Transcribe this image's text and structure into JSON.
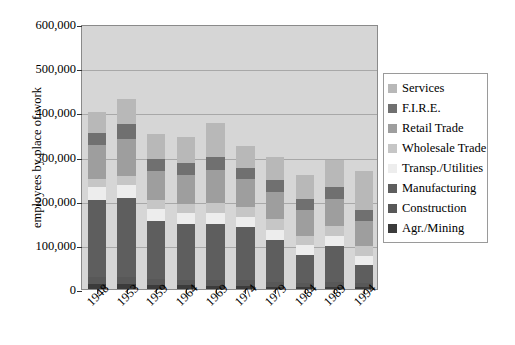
{
  "chart_data": {
    "type": "bar",
    "subtype": "stacked-bar",
    "title": "",
    "xlabel": "",
    "ylabel": "employees by place of work",
    "ylim": [
      0,
      600000
    ],
    "ytick_labels": [
      "600,000",
      "500,000",
      "400,000",
      "300,000",
      "200,000",
      "100,000",
      "0"
    ],
    "ytick_values": [
      600000,
      500000,
      400000,
      300000,
      200000,
      100000,
      0
    ],
    "grid": true,
    "legend_position": "right",
    "categories": [
      "1948",
      "1953",
      "1959",
      "1964",
      "1969",
      "1974",
      "1979",
      "1984",
      "1989",
      "1994"
    ],
    "series": [
      {
        "name": "Agr./Mining",
        "color": "#3b3b3b",
        "values": [
          12000,
          11000,
          9000,
          8000,
          7000,
          6000,
          5000,
          5000,
          5000,
          4000
        ]
      },
      {
        "name": "Construction",
        "color": "#585858",
        "values": [
          15000,
          16000,
          14000,
          13000,
          14000,
          14000,
          12000,
          9000,
          12000,
          9000
        ]
      },
      {
        "name": "Manufacturing",
        "color": "#5e5e5e",
        "values": [
          175000,
          178000,
          132000,
          126000,
          127000,
          120000,
          95000,
          64000,
          81000,
          42000
        ]
      },
      {
        "name": "Transp./Utilities",
        "color": "#ededed",
        "values": [
          30000,
          30000,
          26000,
          25000,
          24000,
          23000,
          22000,
          21000,
          21000,
          20000
        ]
      },
      {
        "name": "Wholesale Trade",
        "color": "#c6c6c6",
        "values": [
          17000,
          20000,
          20000,
          20000,
          23000,
          22000,
          24000,
          22000,
          24000,
          22000
        ]
      },
      {
        "name": "Retail Trade",
        "color": "#9e9e9e",
        "values": [
          76000,
          84000,
          66000,
          66000,
          74000,
          64000,
          62000,
          58000,
          62000,
          58000
        ]
      },
      {
        "name": "F.I.R.E.",
        "color": "#707070",
        "values": [
          28000,
          34000,
          27000,
          27000,
          30000,
          26000,
          26000,
          25000,
          27000,
          25000
        ]
      },
      {
        "name": "Services",
        "color": "#b8b8b8",
        "values": [
          47000,
          57000,
          58000,
          60000,
          76000,
          50000,
          54000,
          54000,
          60000,
          88000
        ]
      }
    ],
    "stack_totals": [
      400000,
      430000,
      352000,
      345000,
      375000,
      325000,
      300000,
      258000,
      292000,
      268000
    ]
  },
  "legend": {
    "items": [
      {
        "label": "Services",
        "color": "#b8b8b8"
      },
      {
        "label": "F.I.R.E.",
        "color": "#707070"
      },
      {
        "label": "Retail Trade",
        "color": "#9e9e9e"
      },
      {
        "label": "Wholesale Trade",
        "color": "#c6c6c6"
      },
      {
        "label": "Transp./Utilities",
        "color": "#ededed"
      },
      {
        "label": "Manufacturing",
        "color": "#5e5e5e"
      },
      {
        "label": "Construction",
        "color": "#585858"
      },
      {
        "label": "Agr./Mining",
        "color": "#3b3b3b"
      }
    ]
  },
  "plot": {
    "background_color": "#d6d6d6",
    "border_color": "#8a8a8a",
    "gridline_color": "#a8a8a8"
  }
}
